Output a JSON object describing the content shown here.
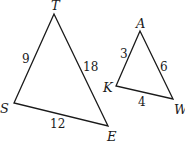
{
  "diagram": {
    "type": "similar-triangles",
    "triangles": [
      {
        "name": "TSE",
        "vertices": [
          {
            "label": "T",
            "x": 54,
            "y": 14
          },
          {
            "label": "S",
            "x": 14,
            "y": 103
          },
          {
            "label": "E",
            "x": 108,
            "y": 126
          }
        ],
        "sides": [
          {
            "between": "T-S",
            "length": "9"
          },
          {
            "between": "T-E",
            "length": "18"
          },
          {
            "between": "S-E",
            "length": "12"
          }
        ]
      },
      {
        "name": "AKW",
        "vertices": [
          {
            "label": "A",
            "x": 140,
            "y": 31
          },
          {
            "label": "K",
            "x": 116,
            "y": 86
          },
          {
            "label": "W",
            "x": 173,
            "y": 99
          }
        ],
        "sides": [
          {
            "between": "A-K",
            "length": "3"
          },
          {
            "between": "A-W",
            "length": "6"
          },
          {
            "between": "K-W",
            "length": "4"
          }
        ]
      }
    ],
    "labels": {
      "T": "T",
      "S": "S",
      "E": "E",
      "A": "A",
      "K": "K",
      "W": "W",
      "TS": "9",
      "TE": "18",
      "SE": "12",
      "AK": "3",
      "AW": "6",
      "KW": "4"
    }
  }
}
